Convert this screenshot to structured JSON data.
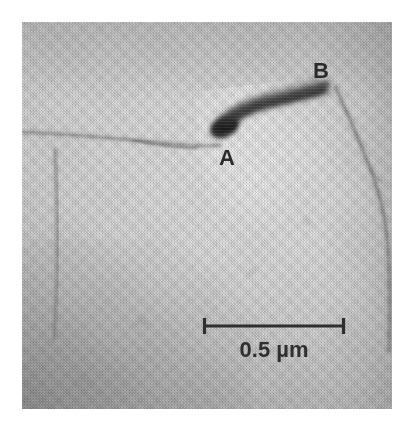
{
  "figure": {
    "kind": "electron-micrograph",
    "caption_text": "",
    "background_color": "#ffffff",
    "panel": {
      "left": 22,
      "top": 22,
      "width": 370,
      "height": 387,
      "mean_tone": "#cccccc",
      "darkest_tone": "#a8a8a8",
      "lightest_tone": "#e8e8e8"
    }
  },
  "annotations": {
    "label_a": "A",
    "label_b": "B",
    "label_color": "#2b2b2b"
  },
  "scale_bar": {
    "caption": "0.5 µm",
    "value": 0.5,
    "unit": "µm",
    "bar_color": "#2f2f2f",
    "bar_left_px": 203,
    "bar_right_px": 345,
    "bar_y_px": 326,
    "bar_length_px": 142
  },
  "features": {
    "dark_defect": {
      "name": "dark-elongated-defect",
      "description": "dark contrast band running from A up-right to B"
    },
    "thin_line": {
      "name": "thin-horizontal-line",
      "description": "faint thin line entering from left edge toward A"
    },
    "grain_boundary_left": {
      "name": "vertical-grain-boundary",
      "description": "faint near-vertical boundary in left portion"
    },
    "grain_boundary_right": {
      "name": "diagonal-grain-boundary",
      "description": "boundary descending from B toward lower-right edge"
    }
  }
}
